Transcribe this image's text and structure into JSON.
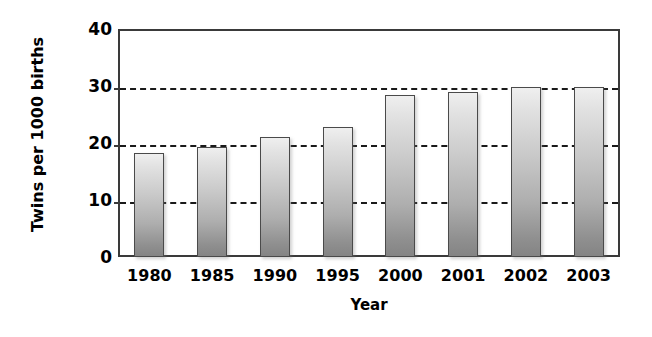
{
  "chart_data": {
    "type": "bar",
    "title": "",
    "xlabel": "Year",
    "ylabel": "Twins per 1000 births",
    "categories": [
      "1980",
      "1985",
      "1990",
      "1995",
      "2000",
      "2001",
      "2002",
      "2003"
    ],
    "values": [
      18.2,
      19.3,
      21.0,
      22.8,
      28.5,
      29.0,
      29.8,
      29.8
    ],
    "ylim": [
      0,
      40
    ],
    "yticks": [
      0,
      10,
      20,
      30,
      40
    ],
    "ytick_labels": [
      "0",
      "10",
      "20",
      "30",
      "40"
    ],
    "gridlines": [
      10,
      20,
      30
    ],
    "grid": true,
    "grid_style": "dashed",
    "legend": null,
    "legend_position": "none",
    "series": [
      {
        "name": "Twins per 1000 births",
        "values": [
          18.2,
          19.3,
          21.0,
          22.8,
          28.5,
          29.0,
          29.8,
          29.8
        ]
      }
    ],
    "bar_fill": "#c4c4c4",
    "bar_border_color": "#4a4a4a",
    "axis_color": "#3a3a3a",
    "text_color": "#000000",
    "background": "#ffffff"
  }
}
